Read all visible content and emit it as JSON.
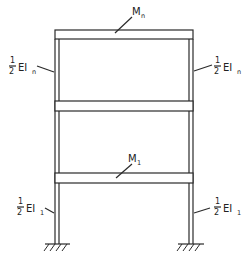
{
  "diagram": {
    "type": "structural frame",
    "labels": {
      "top_beam_mass": {
        "main": "M",
        "sub": "n"
      },
      "lower_beam_mass": {
        "main": "M",
        "sub": "1"
      },
      "upper_left_column": {
        "num": "1",
        "den": "2",
        "main": "EI",
        "sub": "n"
      },
      "upper_right_column": {
        "num": "1",
        "den": "2",
        "main": "EI",
        "sub": "n"
      },
      "lower_left_column": {
        "num": "1",
        "den": "2",
        "main": "EI",
        "sub": "1"
      },
      "lower_right_column": {
        "num": "1",
        "den": "2",
        "main": "EI",
        "sub": "1"
      }
    },
    "colors": {
      "stroke": "#2a2a2a",
      "background": "#ffffff"
    }
  }
}
